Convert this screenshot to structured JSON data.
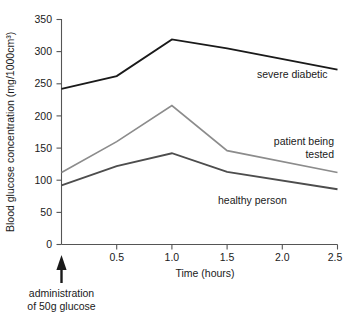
{
  "chart_data": {
    "type": "line",
    "title": "",
    "xlabel": "Time (hours)",
    "ylabel": "Blood glucose concentration (mg/1000cm³)",
    "xlim": [
      0,
      2.5
    ],
    "ylim": [
      0,
      350
    ],
    "grid": false,
    "legend_position": "inline-right-of-curves",
    "x": [
      0,
      0.5,
      1.0,
      1.5,
      2.5
    ],
    "xticks": [
      "0.5",
      "1.0",
      "1.5",
      "2.0",
      "2.5"
    ],
    "xtick_values": [
      0.5,
      1.0,
      1.5,
      2.0,
      2.5
    ],
    "yticks": [
      "0",
      "50",
      "100",
      "150",
      "200",
      "250",
      "300",
      "350"
    ],
    "ytick_values": [
      0,
      50,
      100,
      150,
      200,
      250,
      300,
      350
    ],
    "series": [
      {
        "name": "severe diabetic",
        "color": "#1a1a1a",
        "width": 1.9,
        "values": [
          242,
          262,
          319,
          305,
          272
        ],
        "label_x": 2.02,
        "label_y": 248,
        "label_anchor": "start"
      },
      {
        "name": "patient being tested",
        "color": "#8c8c8c",
        "width": 1.7,
        "values": [
          112,
          160,
          216,
          146,
          112
        ],
        "label_line1": "patient being",
        "label_line2": "tested",
        "label_x": 2.47,
        "label_y": 168,
        "label_anchor": "end"
      },
      {
        "name": "healthy person",
        "color": "#4d4d4d",
        "width": 1.9,
        "values": [
          92,
          122,
          142,
          113,
          86
        ],
        "label_x": 1.82,
        "label_y": 73,
        "label_anchor": "start"
      }
    ],
    "annotations": [
      {
        "name": "administration-marker",
        "arrow_at_x": 0.0,
        "line1": "administration",
        "line2": "of 50g glucose"
      }
    ]
  },
  "axis": {
    "y_title": "Blood glucose concentration (mg/1000cm³)",
    "x_title": "Time (hours)"
  },
  "labels": {
    "severe_diabetic": "severe diabetic",
    "patient_being": "patient being",
    "tested": "tested",
    "healthy_person": "healthy person",
    "administration": "administration",
    "of_50g_glucose": "of 50g glucose"
  },
  "yticks": {
    "t0": "0",
    "t50": "50",
    "t100": "100",
    "t150": "150",
    "t200": "200",
    "t250": "250",
    "t300": "300",
    "t350": "350"
  },
  "xticks": {
    "t05": "0.5",
    "t10": "1.0",
    "t15": "1.5",
    "t20": "2.0",
    "t25": "2.5"
  }
}
